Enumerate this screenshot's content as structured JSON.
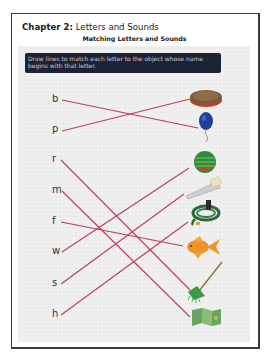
{
  "header": {
    "chapter_label": "Chapter 2:",
    "chapter_title": "Letters and Sounds",
    "subtitle": "Matching Letters and Sounds"
  },
  "instructions": "Draw lines to match each letter to the object whose name begins with that letter.",
  "line_color": "#c0395a",
  "letters": [
    {
      "char": "b",
      "y": 100
    },
    {
      "char": "p",
      "y": 131
    },
    {
      "char": "r",
      "y": 160
    },
    {
      "char": "m",
      "y": 191
    },
    {
      "char": "f",
      "y": 222
    },
    {
      "char": "w",
      "y": 252
    },
    {
      "char": "s",
      "y": 284
    },
    {
      "char": "h",
      "y": 315
    }
  ],
  "objects": [
    {
      "name": "pie",
      "y": 97
    },
    {
      "name": "balloon",
      "y": 122
    },
    {
      "name": "watermelon",
      "y": 163
    },
    {
      "name": "saw",
      "y": 188
    },
    {
      "name": "hose",
      "y": 215
    },
    {
      "name": "goldfish",
      "y": 248
    },
    {
      "name": "rake",
      "y": 283
    },
    {
      "name": "map",
      "y": 317
    }
  ],
  "matches": [
    {
      "letter": "b",
      "object": "balloon"
    },
    {
      "letter": "p",
      "object": "pie"
    },
    {
      "letter": "r",
      "object": "rake"
    },
    {
      "letter": "m",
      "object": "map"
    },
    {
      "letter": "f",
      "object": "goldfish"
    },
    {
      "letter": "w",
      "object": "watermelon"
    },
    {
      "letter": "s",
      "object": "saw"
    },
    {
      "letter": "h",
      "object": "hose"
    }
  ]
}
